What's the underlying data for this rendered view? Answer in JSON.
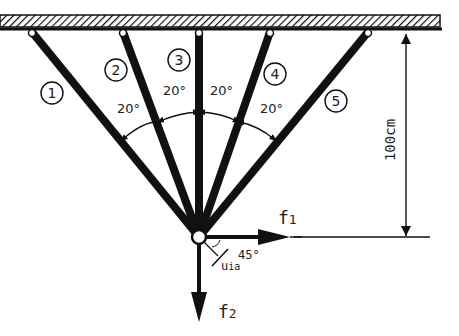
{
  "diagram": {
    "type": "five-bar truss hung from ceiling",
    "colors": {
      "ink": "#111111",
      "background": "#ffffff"
    },
    "ceiling": {
      "x1": 0,
      "x2": 440,
      "y": 15,
      "height": 15,
      "hatch": true
    },
    "node": {
      "x": 199,
      "y": 237,
      "r": 7
    },
    "bars": [
      {
        "id": "1",
        "label": "1",
        "top": [
          32,
          32
        ],
        "label_pos": [
          47,
          96
        ]
      },
      {
        "id": "2",
        "label": "2",
        "top": [
          123,
          32
        ],
        "label_pos": [
          116,
          70
        ]
      },
      {
        "id": "3",
        "label": "3",
        "top": [
          199,
          32
        ],
        "label_pos": [
          179,
          60
        ]
      },
      {
        "id": "4",
        "label": "4",
        "top": [
          270,
          32
        ],
        "label_pos": [
          275,
          74
        ]
      },
      {
        "id": "5",
        "label": "5",
        "top": [
          368,
          32
        ],
        "label_pos": [
          336,
          101
        ]
      }
    ],
    "angles": [
      {
        "label": "20°",
        "x": 117,
        "y": 113
      },
      {
        "label": "20°",
        "x": 163,
        "y": 95
      },
      {
        "label": "20°",
        "x": 210,
        "y": 95
      },
      {
        "label": "20°",
        "x": 260,
        "y": 113
      }
    ],
    "dimension": {
      "label": "100cm",
      "x": 406,
      "y_top": 32,
      "y_bottom": 237
    },
    "forces": [
      {
        "id": "f1",
        "label": "f",
        "subscript": "1",
        "direction": "right"
      },
      {
        "id": "f2",
        "label": "f",
        "subscript": "2",
        "direction": "down"
      }
    ],
    "displacement": {
      "label": "u",
      "subscript": "ia",
      "angle_label": "45°"
    }
  }
}
